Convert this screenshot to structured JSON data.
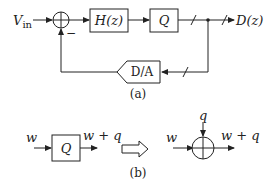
{
  "figure_a": {
    "input_label": "V",
    "input_subscript": "in",
    "minus_sign": "−",
    "filter_block": "H(z)",
    "quantizer_block": "Q",
    "output_label": "D(z)",
    "dac_block": "D/A",
    "caption": "(a)"
  },
  "figure_b": {
    "input_label": "w",
    "quantizer_block": "Q",
    "output_label": "w + q",
    "noise_label": "q",
    "equivalent_input_label": "w",
    "equivalent_output_label": "w + q",
    "caption": "(b)"
  }
}
